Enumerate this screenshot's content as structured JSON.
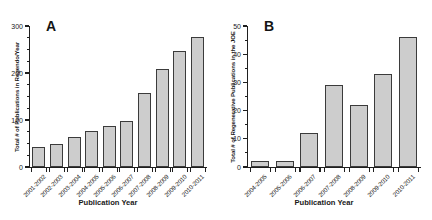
{
  "figure": {
    "background": "#ffffff",
    "bar_fill": "#cdcdcd",
    "bar_stroke": "#3b3b3b",
    "axis_color": "#1f1f1f"
  },
  "panels": [
    {
      "letter": "A",
      "xtitle": "Publication Year"
    },
    {
      "letter": "B",
      "xtitle": "Publication Year"
    }
  ],
  "chart_data": [
    {
      "type": "bar",
      "panel": "A",
      "title": "A",
      "xlabel": "Publication Year",
      "ylabel": "Total # of Publications in Regendo/Year",
      "ylim": [
        0,
        300
      ],
      "yticks": [
        0,
        100,
        200,
        300
      ],
      "ytick_labels": [
        "0",
        "100",
        "200",
        "300"
      ],
      "grid": false,
      "legend": null,
      "categories": [
        "2001-2002",
        "2002-2003",
        "2003-2004",
        "2004-2005",
        "2005-2006",
        "2006-2007",
        "2007-2008",
        "2008-2009",
        "2009-2010",
        "2010-2011"
      ],
      "values": [
        42,
        48,
        64,
        77,
        87,
        97,
        158,
        208,
        247,
        277
      ]
    },
    {
      "type": "bar",
      "panel": "B",
      "title": "B",
      "xlabel": "Publication Year",
      "ylabel": "Total # of Regenerative Publications in the JOE",
      "ylim": [
        0,
        50
      ],
      "yticks": [
        0,
        10,
        20,
        30,
        40,
        50
      ],
      "ytick_labels": [
        "0",
        "10",
        "20",
        "30",
        "40",
        "50"
      ],
      "grid": false,
      "legend": null,
      "categories": [
        "2004-2005",
        "2005-2006",
        "2006-2007",
        "2007-2008",
        "2008-2009",
        "2009-2010",
        "2010-2011"
      ],
      "values": [
        2,
        2,
        12,
        29,
        22,
        33,
        46
      ]
    }
  ]
}
